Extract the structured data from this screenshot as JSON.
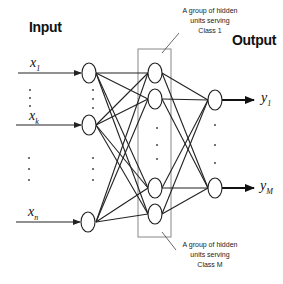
{
  "diagram": {
    "input_title": "Input",
    "output_title": "Output",
    "inputs": [
      {
        "symbol": "x",
        "subscript": "1"
      },
      {
        "symbol": "x",
        "subscript": "k"
      },
      {
        "symbol": "x",
        "subscript": "n"
      }
    ],
    "outputs": [
      {
        "symbol": "y",
        "subscript": "1"
      },
      {
        "symbol": "y",
        "subscript": "M"
      }
    ],
    "annotations": {
      "class1": {
        "line1": "A group of hidden",
        "line2": "units serving",
        "line3": "Class 1"
      },
      "classM": {
        "line1": "A group of hidden",
        "line2": "units serving",
        "line3": "Class M"
      }
    },
    "colors": {
      "stroke": "#222222",
      "box": "#888888",
      "background": "#ffffff"
    }
  }
}
